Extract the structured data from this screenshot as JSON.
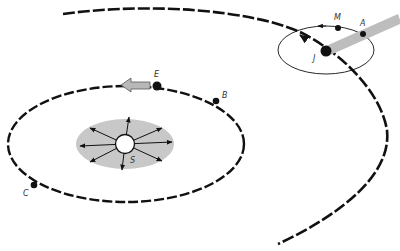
{
  "diagram": {
    "labels": {
      "sun": "S",
      "earth": "E",
      "point_b": "B",
      "point_c": "C",
      "jupiter": "J",
      "moon": "M",
      "point_a": "A"
    },
    "colors": {
      "orbit_stroke": "#111111",
      "shade_gray": "#c8c8c8",
      "arrow_fill": "#b8b8b8",
      "dot": "#111111",
      "sun_fill": "#ffffff",
      "background": "#ffffff"
    }
  }
}
